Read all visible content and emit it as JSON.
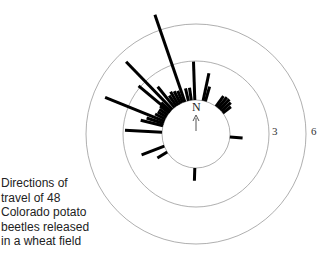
{
  "caption": {
    "lines": [
      "Directions of",
      "travel of 48",
      "Colorado potato",
      "beetles released",
      "in a wheat field"
    ]
  },
  "compass": {
    "label": "N",
    "icon": "north-arrow-icon"
  },
  "rings": [
    {
      "label": "",
      "value": 0
    },
    {
      "label": "3",
      "value": 3
    },
    {
      "label": "6",
      "value": 6
    }
  ],
  "colors": {
    "bars": "#000000",
    "rings": "#9a9a9a",
    "text": "#222222"
  },
  "chart_data": {
    "type": "rose",
    "title": "Directions of travel of 48 Colorado potato beetles released in a wheat field",
    "radial_ticks": [
      3,
      6
    ],
    "orientation": "N at top, angles clockwise in degrees",
    "bars": [
      {
        "angle": 341,
        "length": 7.2
      },
      {
        "angle": 316,
        "length": 5.2
      },
      {
        "angle": 292,
        "length": 5.0
      },
      {
        "angle": 273,
        "length": 2.9
      },
      {
        "angle": 249,
        "length": 1.9
      },
      {
        "angle": 238,
        "length": 0.9
      },
      {
        "angle": 358,
        "length": 3.0
      },
      {
        "angle": 12,
        "length": 2.2
      },
      {
        "angle": 16,
        "length": 1.2
      },
      {
        "angle": 36,
        "length": 1.0
      },
      {
        "angle": 40,
        "length": 1.1
      },
      {
        "angle": 44,
        "length": 1.1
      },
      {
        "angle": 48,
        "length": 1.0
      },
      {
        "angle": 52,
        "length": 0.8
      },
      {
        "angle": 95,
        "length": 1.0
      },
      {
        "angle": 182,
        "length": 1.0
      },
      {
        "angle": 352,
        "length": 1.0
      },
      {
        "angle": 347,
        "length": 1.0
      },
      {
        "angle": 337,
        "length": 1.0
      },
      {
        "angle": 333,
        "length": 1.1
      },
      {
        "angle": 329,
        "length": 1.2
      },
      {
        "angle": 325,
        "length": 1.0
      },
      {
        "angle": 321,
        "length": 2.1
      },
      {
        "angle": 312,
        "length": 1.0
      },
      {
        "angle": 308,
        "length": 0.9
      },
      {
        "angle": 304,
        "length": 0.8
      },
      {
        "angle": 300,
        "length": 0.8
      },
      {
        "angle": 296,
        "length": 0.9
      },
      {
        "angle": 288,
        "length": 1.4
      },
      {
        "angle": 284,
        "length": 1.8
      },
      {
        "angle": 310,
        "length": 3.2
      }
    ]
  }
}
